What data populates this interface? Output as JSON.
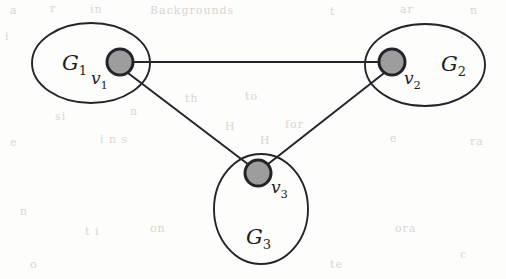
{
  "figure": {
    "caption_text": "",
    "background_color": "#fdfdfc",
    "ink_color": "#24242a",
    "node_fill_color": "#9d9d9d",
    "node_stroke_color": "#232329",
    "groups": [
      {
        "id": "G1",
        "label_main": "G",
        "label_sub": "1",
        "shape": "ellipse",
        "cx": 91,
        "cy": 63,
        "rx": 59,
        "ry": 40,
        "label_x": 62,
        "label_y": 70
      },
      {
        "id": "G2",
        "label_main": "G",
        "label_sub": "2",
        "shape": "ellipse",
        "cx": 425,
        "cy": 65,
        "rx": 60,
        "ry": 41,
        "label_x": 441,
        "label_y": 71
      },
      {
        "id": "G3",
        "label_main": "G",
        "label_sub": "3",
        "shape": "ellipse",
        "cx": 261,
        "cy": 209,
        "rx": 47,
        "ry": 55,
        "label_x": 246,
        "label_y": 244
      }
    ],
    "vertices": [
      {
        "id": "v1",
        "label_main": "v",
        "label_sub": "1",
        "cx": 120,
        "cy": 62,
        "r": 13,
        "label_x": 91,
        "label_y": 84
      },
      {
        "id": "v2",
        "label_main": "v",
        "label_sub": "2",
        "cx": 392,
        "cy": 62,
        "r": 13,
        "label_x": 404,
        "label_y": 84
      },
      {
        "id": "v3",
        "label_main": "v",
        "label_sub": "3",
        "cx": 258,
        "cy": 173,
        "r": 13,
        "label_x": 271,
        "label_y": 193
      }
    ],
    "edges": [
      {
        "id": "edge-v1-v2",
        "from": "v1",
        "to": "v2",
        "x1": 120,
        "y1": 62,
        "x2": 392,
        "y2": 62
      },
      {
        "id": "edge-v1-v3",
        "from": "v1",
        "to": "v3",
        "x1": 124,
        "y1": 70,
        "x2": 253,
        "y2": 168
      },
      {
        "id": "edge-v2-v3",
        "from": "v2",
        "to": "v3",
        "x1": 388,
        "y1": 70,
        "x2": 263,
        "y2": 168
      }
    ],
    "background_artifacts": [
      {
        "text": "Backgrounds",
        "x": 150,
        "y": 4
      },
      {
        "text": "a",
        "x": 10,
        "y": 4
      },
      {
        "text": "r",
        "x": 50,
        "y": 2
      },
      {
        "text": "in",
        "x": 90,
        "y": 3
      },
      {
        "text": "t",
        "x": 330,
        "y": 5
      },
      {
        "text": "ar",
        "x": 400,
        "y": 3
      },
      {
        "text": "n",
        "x": 470,
        "y": 4
      },
      {
        "text": "i",
        "x": 5,
        "y": 30
      },
      {
        "text": "r",
        "x": 460,
        "y": 28
      },
      {
        "text": "th",
        "x": 185,
        "y": 92
      },
      {
        "text": "to",
        "x": 245,
        "y": 90
      },
      {
        "text": "n",
        "x": 130,
        "y": 105
      },
      {
        "text": "H",
        "x": 225,
        "y": 120
      },
      {
        "text": "for",
        "x": 285,
        "y": 118
      },
      {
        "text": "si",
        "x": 55,
        "y": 110
      },
      {
        "text": "e",
        "x": 10,
        "y": 136
      },
      {
        "text": "i n s",
        "x": 100,
        "y": 133
      },
      {
        "text": "H",
        "x": 260,
        "y": 134
      },
      {
        "text": "e",
        "x": 390,
        "y": 132
      },
      {
        "text": "ra",
        "x": 470,
        "y": 135
      },
      {
        "text": "n",
        "x": 20,
        "y": 205
      },
      {
        "text": "t i",
        "x": 85,
        "y": 225
      },
      {
        "text": "on",
        "x": 150,
        "y": 222
      },
      {
        "text": "ora",
        "x": 395,
        "y": 222
      },
      {
        "text": "c",
        "x": 460,
        "y": 248
      },
      {
        "text": "o",
        "x": 30,
        "y": 258
      },
      {
        "text": "te",
        "x": 330,
        "y": 258
      }
    ]
  }
}
